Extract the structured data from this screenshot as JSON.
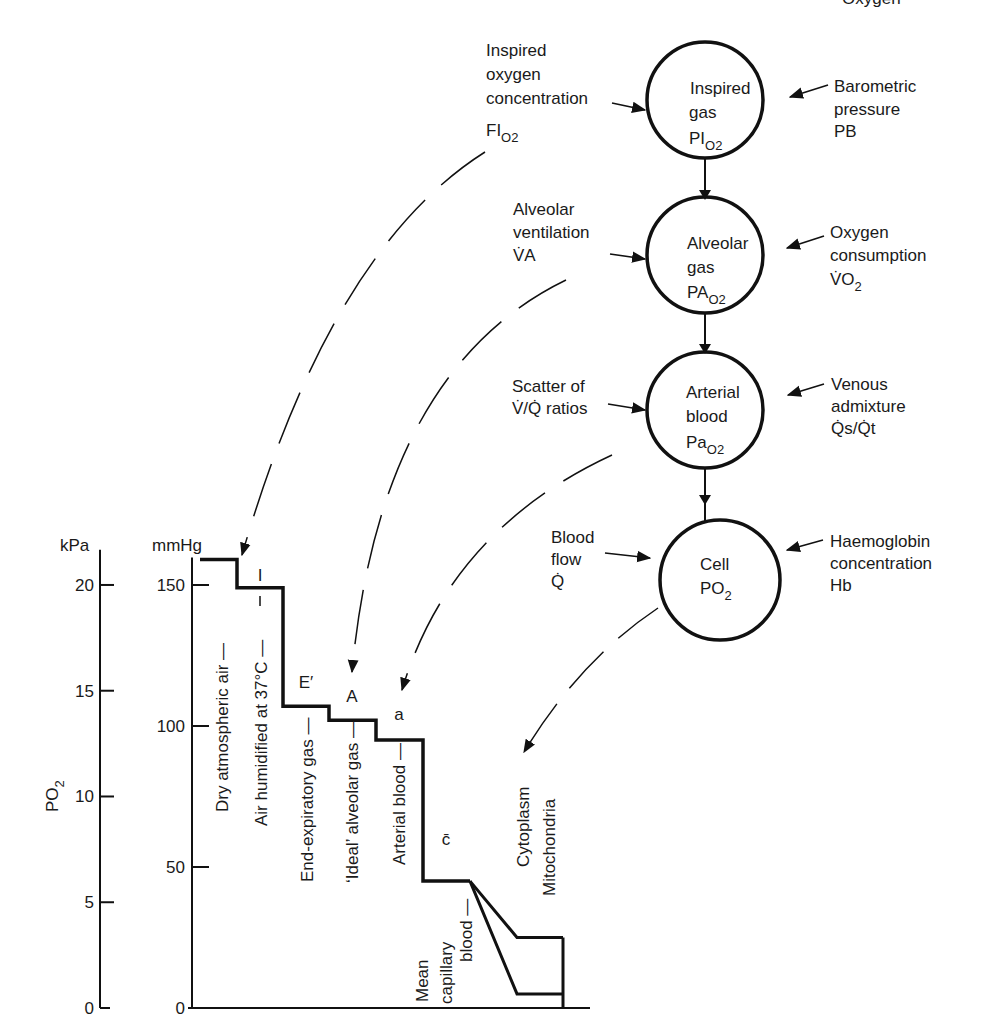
{
  "header": {
    "partial_title": "Oxygen"
  },
  "circles": [
    {
      "id": "inspired",
      "lines": [
        "Inspired",
        "gas"
      ],
      "symbol": "PI",
      "subscript": "O2"
    },
    {
      "id": "alveolar",
      "lines": [
        "Alveolar",
        "gas"
      ],
      "symbol": "PA",
      "subscript": "O2"
    },
    {
      "id": "arterial",
      "lines": [
        "Arterial",
        "blood"
      ],
      "symbol": "Pa",
      "subscript": "O2"
    },
    {
      "id": "cell",
      "lines": [
        "Cell"
      ],
      "symbol": "PO",
      "subscript": "2"
    }
  ],
  "left_factors": [
    {
      "lines": [
        "Inspired",
        "oxygen",
        "concentration"
      ],
      "symbol": "FI",
      "subscript": "O2"
    },
    {
      "lines": [
        "Alveolar",
        "ventilation"
      ],
      "symbol": "V̇A"
    },
    {
      "lines": [
        "Scatter of",
        "V̇/Q̇ ratios"
      ]
    },
    {
      "lines": [
        "Blood",
        "flow"
      ],
      "symbol": "Q̇"
    }
  ],
  "right_factors": [
    {
      "lines": [
        "Barometric",
        "pressure"
      ],
      "symbol": "PB"
    },
    {
      "lines": [
        "Oxygen",
        "consumption"
      ],
      "symbol": "V̇O",
      "subscript": "2"
    },
    {
      "lines": [
        "Venous",
        "admixture"
      ],
      "symbol": "Q̇s/Q̇t"
    },
    {
      "lines": [
        "Haemoglobin",
        "concentration"
      ],
      "symbol": "Hb"
    }
  ],
  "chart_data": {
    "type": "line",
    "ylabel": "PO2",
    "ylabel_symbol": "PO",
    "ylabel_subscript": "2",
    "axes": [
      {
        "unit": "kPa",
        "ticks": [
          0,
          5,
          10,
          15,
          20
        ],
        "ylim": [
          0,
          21
        ]
      },
      {
        "unit": "mmHg",
        "ticks": [
          0,
          50,
          100,
          150
        ],
        "ylim": [
          0,
          159
        ]
      }
    ],
    "stages": [
      {
        "label": "Dry atmospheric air —",
        "marker": "",
        "mmHg": 159
      },
      {
        "label": "Air humidified at 37°C —",
        "marker": "I",
        "mmHg": 149
      },
      {
        "label": "End-expiratory gas —",
        "marker": "E′",
        "mmHg": 107
      },
      {
        "label": "‘Ideal’ alveolar gas —",
        "marker": "A",
        "mmHg": 102
      },
      {
        "label": "Arterial blood —",
        "marker": "a",
        "mmHg": 95
      },
      {
        "label": "Mean capillary blood —",
        "label_lines": [
          "Mean",
          "capillary",
          "blood —"
        ],
        "marker": "c̄",
        "mmHg": 45
      }
    ],
    "branches": [
      {
        "label": "Cytoplasm",
        "mmHg": 25
      },
      {
        "label": "Mitochondria",
        "mmHg": 5
      }
    ]
  }
}
